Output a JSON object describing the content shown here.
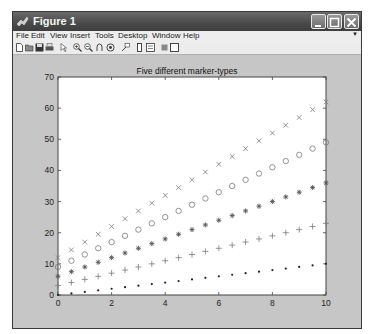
{
  "window": {
    "title": "Figure 1",
    "buttons": [
      "minimize",
      "maximize",
      "close"
    ]
  },
  "menubar": {
    "items": [
      "File",
      "Edit",
      "View",
      "Insert",
      "Tools",
      "Desktop",
      "Window",
      "Help"
    ]
  },
  "toolbar": {
    "icons": [
      "new-figure-icon",
      "open-file-icon",
      "save-icon",
      "print-icon",
      "edit-plot-arrow-icon",
      "zoom-in-icon",
      "zoom-out-icon",
      "pan-icon",
      "rotate-3d-icon",
      "data-cursor-icon",
      "insert-colorbar-icon",
      "insert-legend-icon",
      "hide-plot-tools-icon",
      "show-plot-tools-icon"
    ]
  },
  "chart_data": {
    "type": "scatter",
    "title": "Five different marker-types",
    "xlabel": "",
    "ylabel": "",
    "xlim": [
      0,
      10
    ],
    "ylim": [
      0,
      70
    ],
    "xticks": [
      0,
      2,
      4,
      6,
      8,
      10
    ],
    "yticks": [
      0,
      10,
      20,
      30,
      40,
      50,
      60,
      70
    ],
    "grid": false,
    "legend": null,
    "x": [
      0,
      0.5,
      1,
      1.5,
      2,
      2.5,
      3,
      3.5,
      4,
      4.5,
      5,
      5.5,
      6,
      6.5,
      7,
      7.5,
      8,
      8.5,
      9,
      9.5,
      10
    ],
    "series": [
      {
        "name": "dot",
        "marker": ".",
        "values": [
          0,
          0.5,
          1,
          1.5,
          2,
          2.5,
          3,
          3.5,
          4,
          4.5,
          5,
          5.5,
          6,
          6.5,
          7,
          7.5,
          8,
          8.5,
          9,
          9.5,
          10
        ]
      },
      {
        "name": "plus",
        "marker": "+",
        "values": [
          3,
          4,
          5,
          6,
          7,
          8,
          9,
          10,
          11,
          12,
          13,
          14,
          15,
          16,
          17,
          18,
          19,
          20,
          21,
          22,
          23
        ]
      },
      {
        "name": "asterisk",
        "marker": "*",
        "values": [
          6,
          7.5,
          9,
          10.5,
          12,
          13.5,
          15,
          16.5,
          18,
          19.5,
          21,
          22.5,
          24,
          25.5,
          27,
          28.5,
          30,
          31.5,
          33,
          34.5,
          36
        ]
      },
      {
        "name": "circle",
        "marker": "o",
        "values": [
          9,
          11,
          13,
          15,
          17,
          19,
          21,
          23,
          25,
          27,
          29,
          31,
          33,
          35,
          37,
          39,
          41,
          43,
          45,
          47,
          49
        ]
      },
      {
        "name": "cross",
        "marker": "x",
        "values": [
          12,
          14.5,
          17,
          19.5,
          22,
          24.5,
          27,
          29.5,
          32,
          34.5,
          37,
          39.5,
          42,
          44.5,
          47,
          49.5,
          52,
          54.5,
          57,
          59.5,
          62
        ]
      }
    ],
    "marker_color": "#7a7a7a"
  }
}
